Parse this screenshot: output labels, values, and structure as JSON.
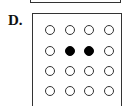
{
  "option": {
    "label": "D.",
    "grid": {
      "rows": 4,
      "cols": 4,
      "cells": [
        [
          0,
          0,
          0,
          0
        ],
        [
          0,
          1,
          1,
          0
        ],
        [
          0,
          0,
          0,
          0
        ],
        [
          0,
          0,
          0,
          0
        ]
      ],
      "legend": {
        "0": "empty circle",
        "1": "filled circle"
      }
    }
  }
}
